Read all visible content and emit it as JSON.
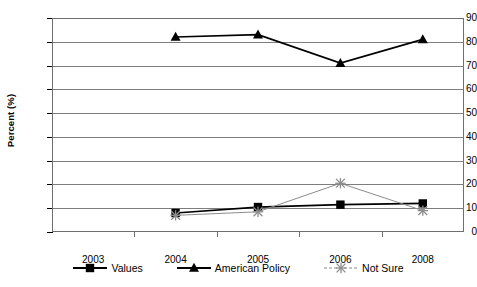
{
  "chart_data": {
    "type": "line",
    "title": "",
    "xlabel": "",
    "ylabel": "Percent (%)",
    "ylim": [
      0,
      90
    ],
    "ytick_step": 10,
    "yticks": [
      0,
      10,
      20,
      30,
      40,
      50,
      60,
      70,
      80,
      90
    ],
    "categories": [
      "2003",
      "2004",
      "2005",
      "2006",
      "2008"
    ],
    "grid": true,
    "legend_position": "bottom",
    "series": [
      {
        "name": "Values",
        "color": "#000000",
        "marker": "square",
        "line_style": "solid",
        "values": [
          null,
          8,
          10.5,
          11.5,
          12
        ]
      },
      {
        "name": "American Policy",
        "color": "#000000",
        "marker": "triangle",
        "line_style": "solid",
        "values": [
          null,
          82,
          83,
          71,
          81
        ]
      },
      {
        "name": "Not Sure",
        "color": "#8c8c8c",
        "marker": "x",
        "line_style": "solid",
        "values": [
          null,
          7,
          8.5,
          20.5,
          9
        ]
      }
    ]
  },
  "axis": {
    "y_title": "Percent (%)",
    "ytick_labels": [
      "0",
      "10",
      "20",
      "30",
      "40",
      "50",
      "60",
      "70",
      "80",
      "90"
    ],
    "xtick_labels": [
      "2003",
      "2004",
      "2005",
      "2006",
      "2008"
    ]
  },
  "legend": {
    "items": [
      {
        "label": "Values",
        "color": "#000000",
        "marker": "square"
      },
      {
        "label": "American Policy",
        "color": "#000000",
        "marker": "triangle"
      },
      {
        "label": "Not Sure",
        "color": "#8c8c8c",
        "marker": "x"
      }
    ]
  }
}
